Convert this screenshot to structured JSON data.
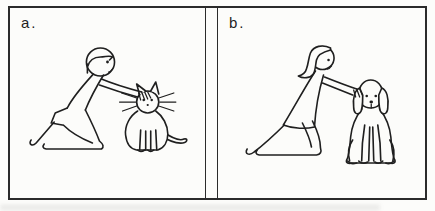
{
  "figure": {
    "panels": [
      {
        "id": "a",
        "label": "a.",
        "scene": "person kneeling and petting a cat"
      },
      {
        "id": "b",
        "label": "b.",
        "scene": "person kneeling and petting a dog"
      }
    ]
  },
  "colors": {
    "ink": "#1f1f1f",
    "paper": "#fcfcfa",
    "border": "#2b2b2b"
  }
}
